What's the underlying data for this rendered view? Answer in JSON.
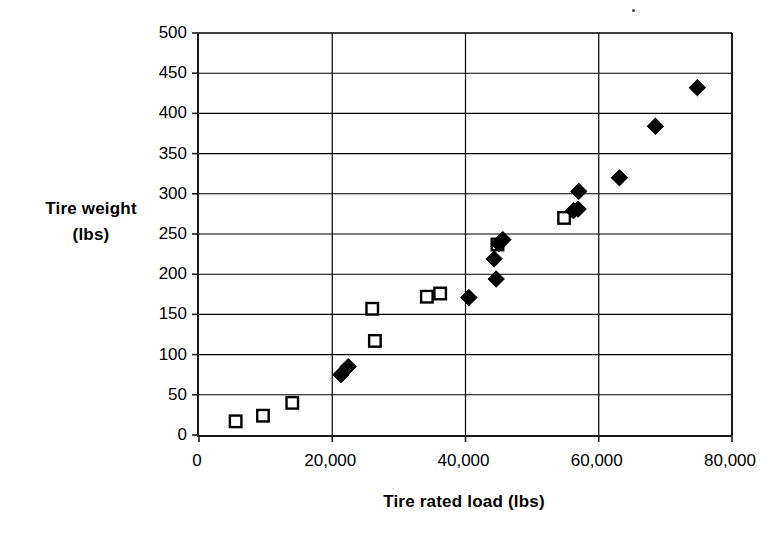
{
  "chart_data": {
    "type": "scatter",
    "title": "",
    "xlabel": "Tire rated load (lbs)",
    "ylabel_line1": "Tire weight",
    "ylabel_line2": "(lbs)",
    "xlim": [
      0,
      80000
    ],
    "ylim": [
      0,
      500
    ],
    "xticks": [
      0,
      20000,
      40000,
      60000,
      80000
    ],
    "xtick_labels": [
      "0",
      "20,000",
      "40,000",
      "60,000",
      "80,000"
    ],
    "yticks": [
      0,
      50,
      100,
      150,
      200,
      250,
      300,
      350,
      400,
      450,
      500
    ],
    "ytick_labels": [
      "0",
      "50",
      "100",
      "150",
      "200",
      "250",
      "300",
      "350",
      "400",
      "450",
      "500"
    ],
    "grid": {
      "horizontal": true,
      "vertical": true,
      "color": "#000000"
    },
    "legend": {
      "visible": false,
      "position": "none"
    },
    "series": [
      {
        "name": "open-square-series",
        "marker": "open-square",
        "marker_fill": "#ffffff",
        "marker_stroke": "#000000",
        "points": [
          {
            "x": 5500,
            "y": 17
          },
          {
            "x": 9600,
            "y": 24
          },
          {
            "x": 14000,
            "y": 40
          },
          {
            "x": 26000,
            "y": 157
          },
          {
            "x": 26400,
            "y": 117
          },
          {
            "x": 34200,
            "y": 172
          },
          {
            "x": 36200,
            "y": 176
          },
          {
            "x": 44800,
            "y": 237
          },
          {
            "x": 54800,
            "y": 270
          }
        ]
      },
      {
        "name": "filled-diamond-series",
        "marker": "filled-diamond",
        "marker_fill": "#000000",
        "marker_stroke": "#000000",
        "points": [
          {
            "x": 21300,
            "y": 75
          },
          {
            "x": 22400,
            "y": 85
          },
          {
            "x": 40500,
            "y": 171
          },
          {
            "x": 44600,
            "y": 194
          },
          {
            "x": 44300,
            "y": 219
          },
          {
            "x": 45000,
            "y": 238
          },
          {
            "x": 45600,
            "y": 243
          },
          {
            "x": 56200,
            "y": 279
          },
          {
            "x": 56900,
            "y": 281
          },
          {
            "x": 57000,
            "y": 303
          },
          {
            "x": 63100,
            "y": 320
          },
          {
            "x": 68500,
            "y": 384
          },
          {
            "x": 74800,
            "y": 432
          }
        ]
      }
    ]
  }
}
